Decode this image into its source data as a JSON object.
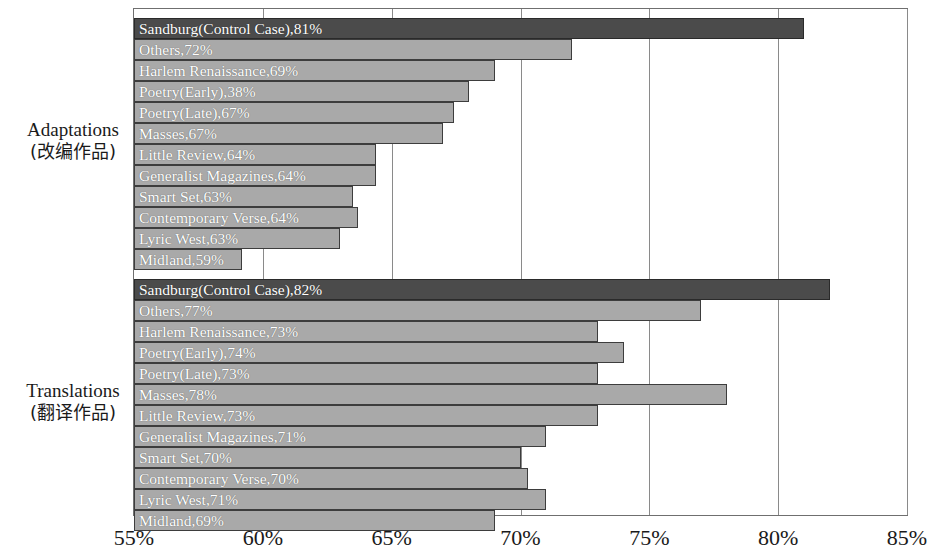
{
  "chart_data": {
    "type": "bar",
    "orientation": "horizontal",
    "title": "",
    "xlabel": "",
    "ylabel": "",
    "xlim": [
      55,
      85
    ],
    "xticks": [
      "55%",
      "60%",
      "65%",
      "70%",
      "75%",
      "80%",
      "85%"
    ],
    "xtick_values": [
      55,
      60,
      65,
      70,
      75,
      80,
      85
    ],
    "grid": true,
    "legend": "none",
    "colors": {
      "control_bar": "#4b4b4b",
      "standard_bar": "#a9a9a9",
      "bar_border": "#3d3d3d",
      "gridline": "#8a8a8a",
      "frame": "#6f6f6f",
      "bar_label_text": "#ffffff",
      "axis_text": "#1a1a1a"
    },
    "groups": [
      {
        "name": "Adaptations",
        "label_en": "Adaptations",
        "label_cn": "(改编作品)",
        "categories": [
          "Sandburg(Control Case)",
          "Others",
          "Harlem Renaissance",
          "Poetry(Early)",
          "Poetry(Late)",
          "Masses",
          "Little Review",
          "Generalist Magazines",
          "Smart Set",
          "Contemporary Verse",
          "Lyric West",
          "Midland"
        ],
        "bars": [
          {
            "label": "Sandburg(Control Case),81%",
            "value": 81,
            "is_control": true
          },
          {
            "label": "Others,72%",
            "value": 72,
            "is_control": false
          },
          {
            "label": "Harlem Renaissance,69%",
            "value": 69,
            "is_control": false
          },
          {
            "label": "Poetry(Early),38%",
            "value": 68,
            "is_control": false
          },
          {
            "label": "Poetry(Late),67%",
            "value": 67.4,
            "is_control": false
          },
          {
            "label": "Masses,67%",
            "value": 67,
            "is_control": false
          },
          {
            "label": "Little Review,64%",
            "value": 64.4,
            "is_control": false
          },
          {
            "label": "Generalist Magazines,64%",
            "value": 64.4,
            "is_control": false
          },
          {
            "label": "Smart Set,63%",
            "value": 63.5,
            "is_control": false
          },
          {
            "label": "Contemporary Verse,64%",
            "value": 63.7,
            "is_control": false
          },
          {
            "label": "Lyric West,63%",
            "value": 63,
            "is_control": false
          },
          {
            "label": "Midland,59%",
            "value": 59.2,
            "is_control": false
          }
        ]
      },
      {
        "name": "Translations",
        "label_en": "Translations",
        "label_cn": "(翻译作品)",
        "categories": [
          "Sandburg(Control Case)",
          "Others",
          "Harlem Renaissance",
          "Poetry(Early)",
          "Poetry(Late)",
          "Masses",
          "Little Review",
          "Generalist Magazines",
          "Smart Set",
          "Contemporary Verse",
          "Lyric West",
          "Midland"
        ],
        "bars": [
          {
            "label": "Sandburg(Control Case),82%",
            "value": 82,
            "is_control": true
          },
          {
            "label": "Others,77%",
            "value": 77,
            "is_control": false
          },
          {
            "label": "Harlem Renaissance,73%",
            "value": 73,
            "is_control": false
          },
          {
            "label": "Poetry(Early),74%",
            "value": 74,
            "is_control": false
          },
          {
            "label": "Poetry(Late),73%",
            "value": 73,
            "is_control": false
          },
          {
            "label": "Masses,78%",
            "value": 78,
            "is_control": false
          },
          {
            "label": "Little Review,73%",
            "value": 73,
            "is_control": false
          },
          {
            "label": "Generalist Magazines,71%",
            "value": 71,
            "is_control": false
          },
          {
            "label": "Smart Set,70%",
            "value": 70,
            "is_control": false
          },
          {
            "label": "Contemporary Verse,70%",
            "value": 70.3,
            "is_control": false
          },
          {
            "label": "Lyric West,71%",
            "value": 71,
            "is_control": false
          },
          {
            "label": "Midland,69%",
            "value": 69,
            "is_control": false
          }
        ]
      }
    ]
  }
}
